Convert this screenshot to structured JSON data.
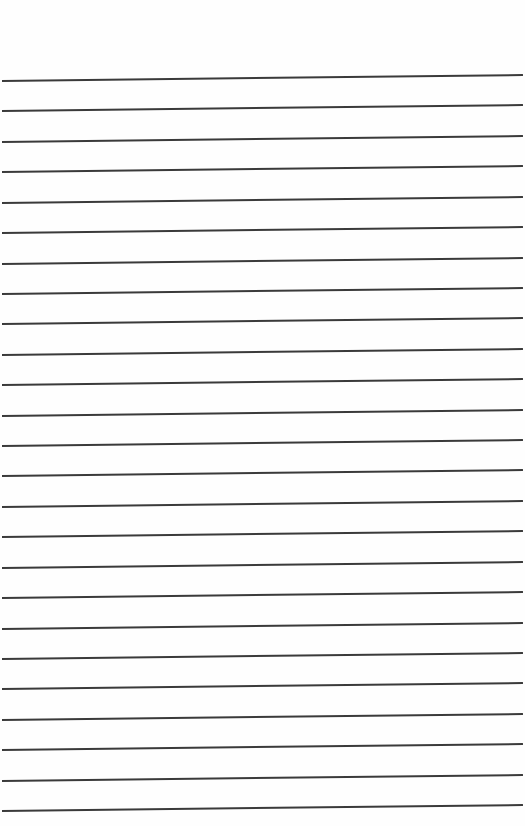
{
  "paper": {
    "type": "lined-paper",
    "background_color": "#fefefe",
    "line_color": "#3a3a3a",
    "line_count": 25,
    "first_line_y": 80,
    "line_spacing": 30.42,
    "tilt_px": 6
  }
}
